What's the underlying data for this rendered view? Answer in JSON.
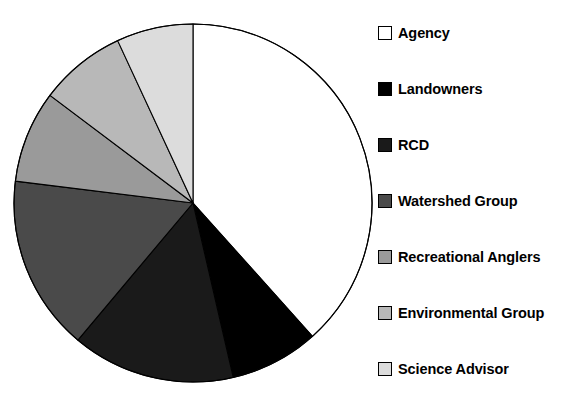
{
  "chart_data": {
    "type": "pie",
    "title": "",
    "subtitle": "",
    "xlabel": "",
    "ylabel": "",
    "grid": false,
    "legend_position": "right",
    "start_angle_deg": 0,
    "direction": "clockwise",
    "categories": [
      "Agency",
      "Landowners",
      "RCD",
      "Watershed Group",
      "Recreational Anglers",
      "Environmental Group",
      "Science Advisor"
    ],
    "values": [
      38.3,
      8.0,
      14.7,
      15.8,
      8.3,
      7.8,
      6.9
    ],
    "angles_deg": [
      138.0,
      28.7,
      52.9,
      56.9,
      29.9,
      28.1,
      25.0
    ],
    "colors": [
      "#ffffff",
      "#000000",
      "#1a1a1a",
      "#4a4a4a",
      "#9a9a9a",
      "#b8b8b8",
      "#dcdcdc"
    ],
    "slice_border_color": "#000000",
    "annotations": []
  },
  "legend": {
    "items": [
      {
        "label": "Agency",
        "color": "#ffffff",
        "swatch_name": "legend-swatch-agency"
      },
      {
        "label": "Landowners",
        "color": "#000000",
        "swatch_name": "legend-swatch-landowners"
      },
      {
        "label": "RCD",
        "color": "#1a1a1a",
        "swatch_name": "legend-swatch-rcd"
      },
      {
        "label": "Watershed Group",
        "color": "#4a4a4a",
        "swatch_name": "legend-swatch-watershed-group"
      },
      {
        "label": "Recreational Anglers",
        "color": "#9a9a9a",
        "swatch_name": "legend-swatch-recreational-anglers"
      },
      {
        "label": "Environmental Group",
        "color": "#b8b8b8",
        "swatch_name": "legend-swatch-environmental-group"
      },
      {
        "label": "Science Advisor",
        "color": "#dcdcdc",
        "swatch_name": "legend-swatch-science-advisor"
      }
    ]
  },
  "pie_geometry": {
    "center_x": 193,
    "center_y": 203,
    "radius": 179
  }
}
